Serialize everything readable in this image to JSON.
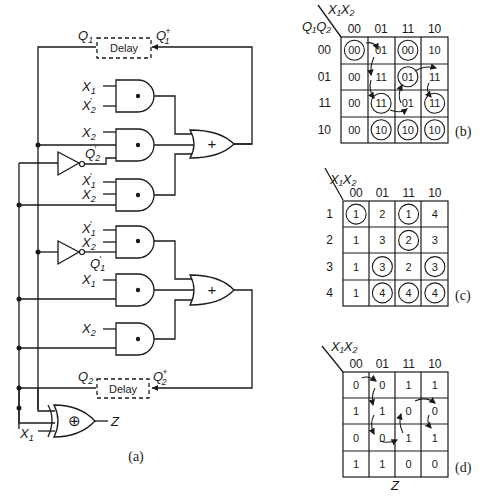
{
  "circuit": {
    "caption": "(a)",
    "delay1": {
      "label": "Delay",
      "out": "Q",
      "out_sub": "1",
      "in": "Q",
      "in_sub": "1",
      "in_sup": "+"
    },
    "delay2": {
      "label": "Delay",
      "out": "Q",
      "out_sub": "2",
      "in": "Q",
      "in_sub": "2",
      "in_sup": "+"
    },
    "inputs": {
      "and1_a": "X",
      "and1_a_sub": "1",
      "and1_b": "X",
      "and1_b_sub": "2",
      "and1_b_prime": "′",
      "and2_a": "X",
      "and2_a_sub": "2",
      "and2_c": "Q",
      "and2_c_sub": "2",
      "and2_c_prime": "′",
      "and3_a": "X",
      "and3_a_sub": "1",
      "and3_a_prime": "′",
      "and3_b": "X",
      "and3_b_sub": "2",
      "and4_a": "X",
      "and4_a_sub": "1",
      "and4_a_prime": "′",
      "and4_b": "X",
      "and4_b_sub": "2",
      "and4_c": "Q",
      "and4_c_sub": "1",
      "and4_c_prime": "′",
      "and5_a": "X",
      "and5_a_sub": "1",
      "and6_a": "X",
      "and6_a_sub": "2",
      "xor_b": "X",
      "xor_b_sub": "1"
    },
    "gate_symbols": {
      "and": "•",
      "or": "+",
      "xor": "⊕"
    },
    "output_label": "Z"
  },
  "maps": {
    "b": {
      "caption": "(b)",
      "col_var": "X₁X₂",
      "row_var": "Q₁Q₂",
      "col_headers": [
        "00",
        "01",
        "11",
        "10"
      ],
      "row_headers": [
        "00",
        "01",
        "11",
        "10"
      ],
      "cells": [
        [
          "00",
          "01",
          "00",
          "10"
        ],
        [
          "00",
          "11",
          "01",
          "11"
        ],
        [
          "00",
          "11",
          "01",
          "11"
        ],
        [
          "00",
          "10",
          "10",
          "10"
        ]
      ],
      "circled": [
        [
          0,
          0
        ],
        [
          0,
          2
        ],
        [
          1,
          2
        ],
        [
          2,
          1
        ],
        [
          2,
          3
        ],
        [
          3,
          1
        ],
        [
          3,
          2
        ],
        [
          3,
          3
        ]
      ]
    },
    "c": {
      "caption": "(c)",
      "col_var": "X₁X₂",
      "col_headers": [
        "00",
        "01",
        "11",
        "10"
      ],
      "row_headers": [
        "1",
        "2",
        "3",
        "4"
      ],
      "cells": [
        [
          "1",
          "2",
          "1",
          "4"
        ],
        [
          "1",
          "3",
          "2",
          "3"
        ],
        [
          "1",
          "3",
          "2",
          "3"
        ],
        [
          "1",
          "4",
          "4",
          "4"
        ]
      ],
      "circled": [
        [
          0,
          0
        ],
        [
          0,
          2
        ],
        [
          1,
          2
        ],
        [
          2,
          1
        ],
        [
          2,
          3
        ],
        [
          3,
          1
        ],
        [
          3,
          2
        ],
        [
          3,
          3
        ]
      ]
    },
    "d": {
      "caption": "(d)",
      "col_var": "X₁X₂",
      "col_headers": [
        "00",
        "01",
        "11",
        "10"
      ],
      "cells": [
        [
          "0",
          "0",
          "1",
          "1"
        ],
        [
          "1",
          "1",
          "0",
          "0"
        ],
        [
          "0",
          "0",
          "1",
          "1"
        ],
        [
          "1",
          "1",
          "0",
          "0"
        ]
      ],
      "bottom_label": "Z"
    }
  }
}
